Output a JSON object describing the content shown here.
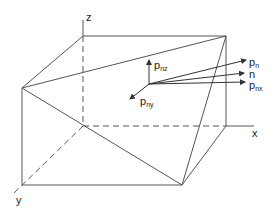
{
  "diagram": {
    "type": "3d-prism-stress-vector",
    "colors": {
      "line": "#444444",
      "text": "#222222",
      "background": "#ffffff"
    },
    "axes": {
      "x": {
        "label": "x"
      },
      "y": {
        "label": "y"
      },
      "z": {
        "label": "z"
      }
    },
    "vectors": {
      "pn": {
        "main": "p",
        "sub": "n"
      },
      "n": {
        "main": "n",
        "sub": ""
      },
      "pnx": {
        "main": "p",
        "sub": "nx"
      },
      "pny": {
        "main": "p",
        "sub": "ny"
      },
      "pnz": {
        "main": "p",
        "sub": "nz"
      }
    }
  }
}
